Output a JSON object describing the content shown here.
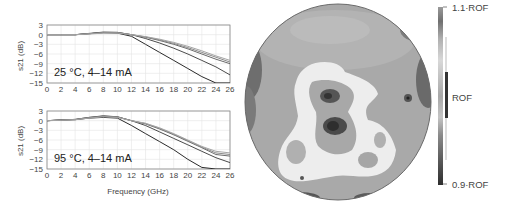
{
  "chart_data": [
    {
      "type": "line",
      "title": "25 °C, 4–14 mA",
      "annotation": "25 °C, 4–14 mA",
      "xlabel": "",
      "ylabel": "s21 (dB)",
      "xlim": [
        0,
        26
      ],
      "ylim": [
        -15,
        3
      ],
      "xticks": [
        0,
        2,
        4,
        6,
        8,
        10,
        12,
        14,
        16,
        18,
        20,
        22,
        24,
        26
      ],
      "yticks": [
        3,
        0,
        -3,
        -6,
        -9,
        -12,
        -15
      ],
      "grid": true,
      "x": [
        0,
        2,
        4,
        6,
        8,
        10,
        12,
        14,
        16,
        18,
        20,
        22,
        24,
        26
      ],
      "series": [
        {
          "name": "4 mA",
          "values": [
            0,
            0,
            0,
            0.3,
            0.6,
            0.5,
            -0.5,
            -3,
            -5.5,
            -8,
            -10.5,
            -13,
            -15,
            -15
          ]
        },
        {
          "name": "6 mA",
          "values": [
            0,
            0,
            0,
            0.4,
            0.8,
            0.7,
            0,
            -1.2,
            -2.6,
            -4.2,
            -6,
            -8,
            -10,
            -12.5
          ]
        },
        {
          "name": "8 mA",
          "values": [
            0,
            0,
            0,
            0.3,
            0.7,
            0.7,
            0,
            -0.8,
            -1.8,
            -3,
            -4.4,
            -6,
            -7.6,
            -9
          ]
        },
        {
          "name": "10 mA",
          "values": [
            0,
            0,
            0,
            0.3,
            0.6,
            0.6,
            0,
            -0.7,
            -1.6,
            -2.7,
            -4,
            -5.5,
            -7,
            -8.5
          ]
        },
        {
          "name": "14 mA",
          "values": [
            0,
            0,
            0,
            0.2,
            0.5,
            0.5,
            0,
            -0.6,
            -1.4,
            -2.4,
            -3.6,
            -5,
            -6.6,
            -8
          ]
        }
      ]
    },
    {
      "type": "line",
      "title": "95 °C, 4–14 mA",
      "annotation": "95 °C, 4–14 mA",
      "xlabel": "Frequency (GHz)",
      "ylabel": "s21 (dB)",
      "xlim": [
        0,
        26
      ],
      "ylim": [
        -15,
        3
      ],
      "xticks": [
        0,
        2,
        4,
        6,
        8,
        10,
        12,
        14,
        16,
        18,
        20,
        22,
        24,
        26
      ],
      "yticks": [
        3,
        0,
        -3,
        -6,
        -9,
        -12,
        -15
      ],
      "grid": true,
      "x": [
        0,
        2,
        4,
        6,
        8,
        10,
        12,
        14,
        16,
        18,
        20,
        22,
        24,
        26
      ],
      "series": [
        {
          "name": "4 mA",
          "values": [
            0,
            0.2,
            0.3,
            0.8,
            1.0,
            0.8,
            -1.5,
            -4,
            -6.5,
            -9,
            -12,
            -14.5,
            -15,
            -15
          ]
        },
        {
          "name": "6 mA",
          "values": [
            0,
            0.2,
            0.4,
            1.0,
            1.5,
            1.2,
            0,
            -1.5,
            -3.5,
            -5.5,
            -7.5,
            -9.5,
            -11.5,
            -13
          ]
        },
        {
          "name": "8 mA",
          "values": [
            0,
            0.2,
            0.4,
            1.0,
            1.4,
            1.2,
            0,
            -1,
            -2.6,
            -4.4,
            -6.4,
            -8.4,
            -10.5,
            -11
          ]
        },
        {
          "name": "10 mA",
          "values": [
            0,
            0.2,
            0.3,
            0.9,
            1.3,
            1.1,
            0,
            -0.9,
            -2.4,
            -4.2,
            -6.2,
            -8.2,
            -10,
            -10.5
          ]
        },
        {
          "name": "14 mA",
          "values": [
            0,
            0.1,
            0.3,
            0.8,
            1.2,
            1.0,
            0,
            -0.8,
            -2.2,
            -4,
            -6,
            -8,
            -9.5,
            -10
          ]
        }
      ]
    },
    {
      "type": "heatmap",
      "title": "",
      "description": "circular wafer map, grayscale",
      "colorbar": {
        "labels": [
          "1.1·ROF",
          "ROF",
          "0.9·ROF"
        ],
        "min_label": "0.9·ROF",
        "mid_label": "ROF",
        "max_label": "1.1·ROF"
      }
    }
  ]
}
